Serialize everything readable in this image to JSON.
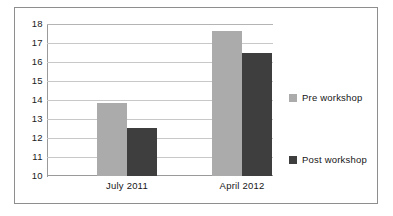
{
  "chart_data": {
    "type": "bar",
    "title": "",
    "subtitle": "",
    "xlabel": "",
    "ylabel": "",
    "categories": [
      "July 2011",
      "April 2012"
    ],
    "series": [
      {
        "name": "Pre workshop",
        "values": [
          13.85,
          17.65
        ],
        "color": "#ababab"
      },
      {
        "name": "Post workshop",
        "values": [
          12.55,
          16.45
        ],
        "color": "#3e3e3e"
      }
    ],
    "ylim": [
      10,
      18
    ],
    "ytick_values": [
      10,
      11,
      12,
      13,
      14,
      15,
      16,
      17,
      18
    ],
    "ytick_labels": [
      "10",
      "11",
      "12",
      "13",
      "14",
      "15",
      "16",
      "17",
      "18"
    ],
    "grid": true,
    "grid_axis": "y",
    "legend_position": "right",
    "frame": true
  },
  "colors": {
    "background": "#ffffff",
    "frame_border": "#8e8e8e",
    "gridline": "#c8c8c8",
    "axis_line": "#9a9a9a",
    "text": "#161616",
    "pre_workshop": "#ababab",
    "post_workshop": "#3e3e3e"
  }
}
